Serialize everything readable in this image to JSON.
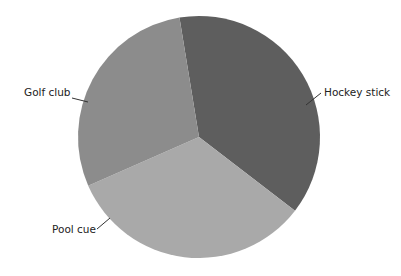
{
  "chart_data": {
    "type": "pie",
    "title": "",
    "start_angle_deg": 350.7,
    "direction": "clockwise",
    "center": [
      199,
      137
    ],
    "radius": 121,
    "categories": [
      "Hockey stick",
      "Pool cue",
      "Golf club"
    ],
    "values": [
      38,
      33,
      29
    ],
    "colors": [
      "#5e5e5e",
      "#a9a9a9",
      "#8c8c8c"
    ],
    "legend": "none",
    "labels": [
      {
        "text": "Hockey stick",
        "x": 324,
        "y": 96,
        "anchor": "start",
        "line": [
          306,
          105,
          321,
          93
        ]
      },
      {
        "text": "Pool cue",
        "x": 52,
        "y": 233,
        "anchor": "start",
        "line": [
          97,
          229,
          110,
          218
        ]
      },
      {
        "text": "Golf club",
        "x": 24,
        "y": 96,
        "anchor": "start",
        "line": [
          72,
          98,
          88,
          102
        ]
      }
    ]
  }
}
